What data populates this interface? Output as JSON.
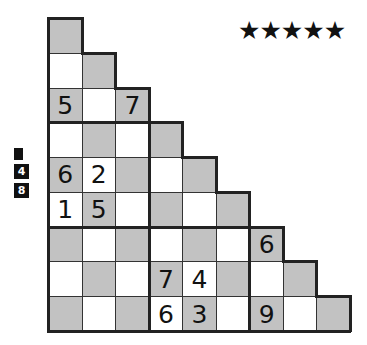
{
  "difficulty": {
    "stars": "★★★★★",
    "count": 5
  },
  "side_hints": {
    "items": [
      "",
      "4",
      "8"
    ]
  },
  "grid": {
    "rows": 9,
    "cols": 9,
    "shape": "staircase-triangle",
    "colors": {
      "shaded": "#c2c2c2",
      "unshaded": "#ffffff",
      "line": "#222222"
    },
    "box_lines": {
      "horizontal_after_rows": [
        2,
        5
      ],
      "vertical_after_cols": [
        2,
        5
      ]
    },
    "givens": [
      {
        "row": 2,
        "col": 0,
        "value": "5"
      },
      {
        "row": 2,
        "col": 2,
        "value": "7"
      },
      {
        "row": 4,
        "col": 0,
        "value": "6"
      },
      {
        "row": 4,
        "col": 1,
        "value": "2"
      },
      {
        "row": 5,
        "col": 0,
        "value": "1"
      },
      {
        "row": 5,
        "col": 1,
        "value": "5"
      },
      {
        "row": 6,
        "col": 6,
        "value": "6"
      },
      {
        "row": 7,
        "col": 3,
        "value": "7"
      },
      {
        "row": 7,
        "col": 4,
        "value": "4"
      },
      {
        "row": 8,
        "col": 3,
        "value": "6"
      },
      {
        "row": 8,
        "col": 4,
        "value": "3"
      },
      {
        "row": 8,
        "col": 6,
        "value": "9"
      }
    ]
  }
}
